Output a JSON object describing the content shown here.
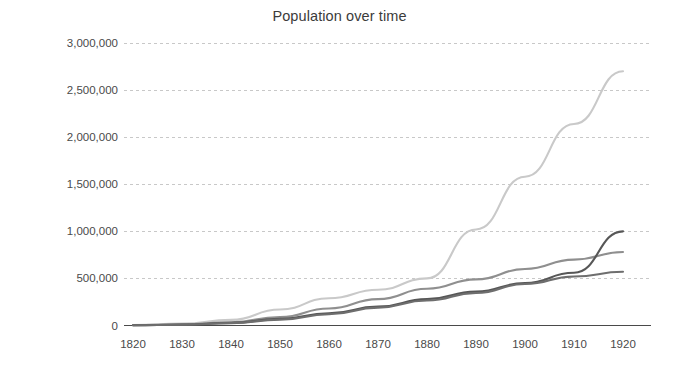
{
  "chart_data": {
    "type": "line",
    "title": "Population over time",
    "xlabel": "",
    "ylabel": "",
    "xlim": [
      1815,
      1922
    ],
    "ylim": [
      0,
      3000000
    ],
    "grid": true,
    "legend": "none",
    "x_tick_labels": [
      "1820",
      "1830",
      "1840",
      "1850",
      "1860",
      "1870",
      "1880",
      "1890",
      "1900",
      "1910",
      "1920"
    ],
    "x_ticks": [
      1820,
      1830,
      1840,
      1850,
      1860,
      1870,
      1880,
      1890,
      1900,
      1910,
      1920
    ],
    "y_tick_labels": [
      "0",
      "500,000",
      "1,000,000",
      "1,500,000",
      "2,000,000",
      "2,500,000",
      "3,000,000"
    ],
    "y_ticks": [
      0,
      500000,
      1000000,
      1500000,
      2000000,
      2500000,
      3000000
    ],
    "x": [
      1820,
      1830,
      1840,
      1850,
      1860,
      1870,
      1880,
      1890,
      1900,
      1910,
      1920
    ],
    "series": [
      {
        "name": "series-1",
        "color": "#c9c9c9",
        "values": [
          5000,
          20000,
          60000,
          170000,
          290000,
          380000,
          500000,
          1020000,
          1580000,
          2140000,
          2700000
        ]
      },
      {
        "name": "series-2",
        "color": "#8f8f8f",
        "values": [
          3000,
          12000,
          35000,
          90000,
          180000,
          280000,
          390000,
          490000,
          600000,
          700000,
          780000
        ]
      },
      {
        "name": "series-3",
        "color": "#575757",
        "values": [
          2000,
          9000,
          28000,
          70000,
          130000,
          200000,
          280000,
          360000,
          450000,
          560000,
          1000000
        ]
      },
      {
        "name": "series-4",
        "color": "#6e6e6e",
        "values": [
          2000,
          8000,
          25000,
          62000,
          120000,
          190000,
          265000,
          345000,
          440000,
          520000,
          570000
        ]
      }
    ]
  },
  "axes": {
    "grid_color": "#c8c8c8",
    "axis_color": "#4a4a4a",
    "tick_label_color": "#4a4a4a",
    "title_color": "#3b3b3b"
  }
}
